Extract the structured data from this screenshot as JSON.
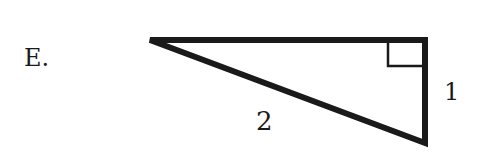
{
  "option": {
    "letter": "E."
  },
  "diagram": {
    "shape": "right-triangle",
    "stroke_color": "#1a1a1a",
    "vertices": {
      "left": [
        150,
        40
      ],
      "top_right": [
        425,
        40
      ],
      "bottom_right": [
        425,
        143
      ]
    },
    "right_angle_at": "top_right",
    "labels": {
      "hypotenuse": "2",
      "vertical_leg": "1"
    }
  }
}
